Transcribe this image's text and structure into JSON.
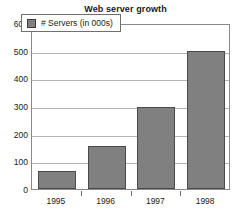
{
  "chart_data": {
    "type": "bar",
    "title": "Web server growth",
    "xlabel": "",
    "ylabel": "",
    "categories": [
      "1995",
      "1996",
      "1997",
      "1998"
    ],
    "values": [
      65,
      155,
      297,
      500
    ],
    "series": [
      {
        "name": "# Servers (in 000s)",
        "values": [
          65,
          155,
          297,
          500
        ]
      }
    ],
    "ylim": [
      0,
      600
    ],
    "yticks": [
      0,
      100,
      200,
      300,
      400,
      500,
      600
    ],
    "ytick_labels": [
      "0",
      "100",
      "200",
      "300",
      "400",
      "500",
      "600"
    ],
    "grid": true,
    "legend": {
      "position": "top-left-inside",
      "entries": [
        {
          "label": "# Servers (in 000s)",
          "color": "#808080"
        }
      ]
    },
    "colors": {
      "bar_fill": "#808080",
      "bar_border": "#4a4a4a",
      "gridline": "#b5b5b5",
      "plot_border": "#8a8a8a",
      "background": "#ffffff",
      "text": "#1a1a1a"
    }
  }
}
